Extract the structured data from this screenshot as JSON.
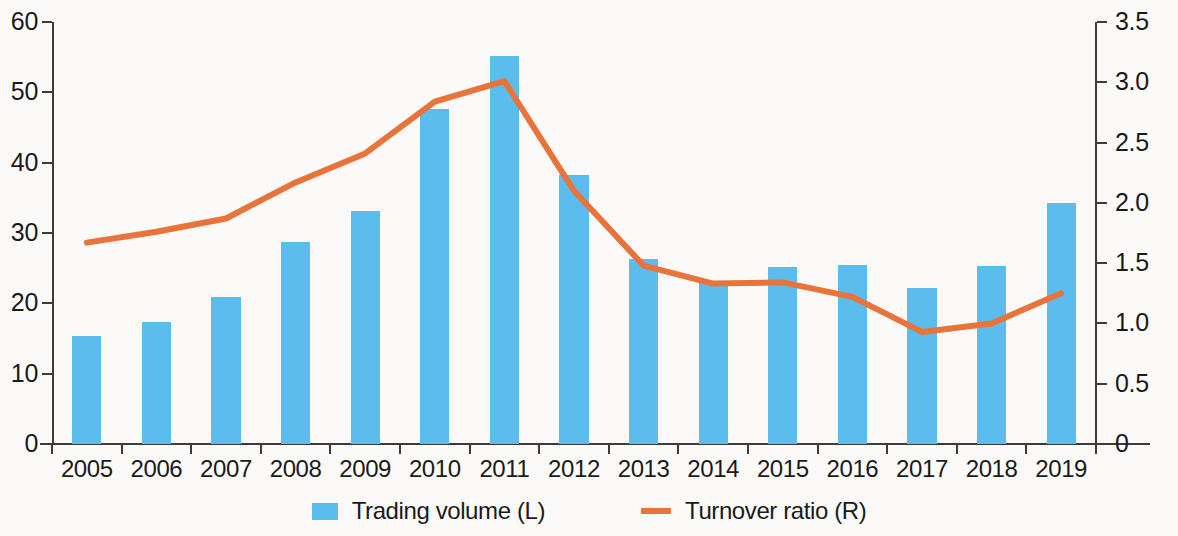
{
  "chart_data": {
    "type": "bar",
    "title": "",
    "xlabel": "",
    "categories": [
      "2005",
      "2006",
      "2007",
      "2008",
      "2009",
      "2010",
      "2011",
      "2012",
      "2013",
      "2014",
      "2015",
      "2016",
      "2017",
      "2018",
      "2019"
    ],
    "series": [
      {
        "name": "Trading volume (L)",
        "type": "bar",
        "axis": "left",
        "color": "#5bbdee",
        "values": [
          15.3,
          17.4,
          20.9,
          28.7,
          33.1,
          47.6,
          55.2,
          38.3,
          26.3,
          23.1,
          25.2,
          25.5,
          22.2,
          25.3,
          34.3
        ]
      },
      {
        "name": "Turnover ratio (R)",
        "type": "line",
        "axis": "right",
        "color": "#e8743b",
        "values": [
          1.67,
          1.76,
          1.87,
          2.17,
          2.41,
          2.84,
          3.01,
          2.1,
          1.48,
          1.33,
          1.34,
          1.22,
          0.93,
          1.0,
          1.25
        ]
      }
    ],
    "left_axis": {
      "label": "",
      "ylim": [
        0,
        60
      ],
      "ticks": [
        "0",
        "10",
        "20",
        "30",
        "40",
        "50",
        "60"
      ],
      "tick_values": [
        0,
        10,
        20,
        30,
        40,
        50,
        60
      ]
    },
    "right_axis": {
      "label": "",
      "ylim": [
        0,
        3.5
      ],
      "ticks": [
        "0",
        "0.5",
        "1.0",
        "1.5",
        "2.0",
        "2.5",
        "3.0",
        "3.5"
      ],
      "tick_values": [
        0,
        0.5,
        1.0,
        1.5,
        2.0,
        2.5,
        3.0,
        3.5
      ]
    },
    "grid": false,
    "legend_position": "bottom-center",
    "legend": [
      {
        "label": "Trading volume (L)",
        "marker": "square",
        "color": "#5bbdee"
      },
      {
        "label": "Turnover ratio (R)",
        "marker": "line",
        "color": "#e8743b"
      }
    ]
  },
  "colors": {
    "bar": "#5bbdee",
    "line": "#e8743b",
    "axis": "#3c3c3c",
    "text": "#1a1a1a",
    "background": "#fbfaf8"
  }
}
